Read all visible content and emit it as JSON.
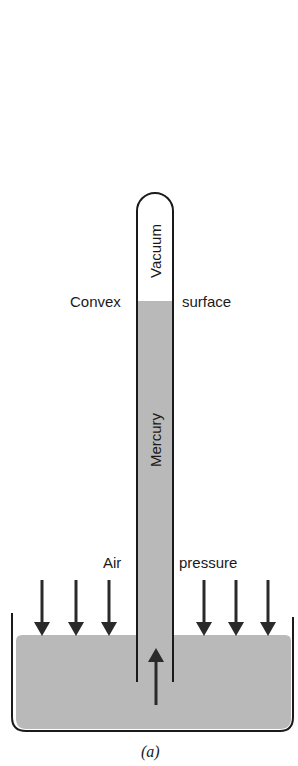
{
  "figure": {
    "caption": "(a)",
    "colors": {
      "mercury_fill": "#b9b9b9",
      "outline": "#1a1a1a",
      "background": "#ffffff"
    }
  },
  "labels": {
    "vacuum": "Vacuum",
    "mercury": "Mercury",
    "convex": "Convex",
    "surface": "surface",
    "air": "Air",
    "pressure": "pressure"
  },
  "arrows": {
    "down_count_left": 3,
    "down_count_right": 3,
    "up_count": 1
  }
}
